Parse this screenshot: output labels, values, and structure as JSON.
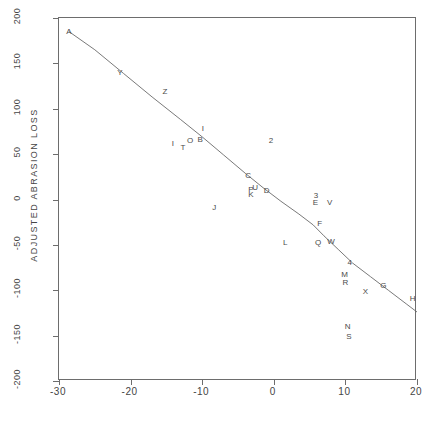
{
  "chart_data": {
    "type": "scatter",
    "title": "",
    "xlabel": "",
    "ylabel": "ADJUSTED ABRASION LOSS",
    "xlim": [
      -30,
      20
    ],
    "ylim": [
      -200,
      200
    ],
    "xticks": [
      -30,
      -20,
      -10,
      0,
      10,
      20
    ],
    "yticks": [
      -200,
      -150,
      -100,
      -50,
      0,
      50,
      100,
      150,
      200
    ],
    "xtick_labels": [
      "-30",
      "-20",
      "-10",
      "0",
      "10",
      "20"
    ],
    "ytick_labels": [
      "-200",
      "-150",
      "-100",
      "-50",
      "0",
      "50",
      "100",
      "150",
      "200"
    ],
    "grid": false,
    "legend": false,
    "point_marker": "letter-label",
    "points": [
      {
        "label": "A",
        "x": -28.6,
        "y": 185
      },
      {
        "label": "Y",
        "x": -21.5,
        "y": 139
      },
      {
        "label": "Z",
        "x": -15.2,
        "y": 119
      },
      {
        "label": "I",
        "x": -9.9,
        "y": 78
      },
      {
        "label": "I",
        "x": -14.1,
        "y": 61
      },
      {
        "label": "T",
        "x": -12.7,
        "y": 57
      },
      {
        "label": "O",
        "x": -11.7,
        "y": 64
      },
      {
        "label": "B",
        "x": -10.3,
        "y": 66
      },
      {
        "label": "2",
        "x": -0.4,
        "y": 64
      },
      {
        "label": "J",
        "x": -8.3,
        "y": -9
      },
      {
        "label": "C",
        "x": -3.6,
        "y": 26
      },
      {
        "label": "P",
        "x": -3.2,
        "y": 10
      },
      {
        "label": "U",
        "x": -2.6,
        "y": 13
      },
      {
        "label": "K",
        "x": -3.2,
        "y": 5
      },
      {
        "label": "D",
        "x": -1.0,
        "y": 9
      },
      {
        "label": "3",
        "x": 5.9,
        "y": 4
      },
      {
        "label": "E",
        "x": 5.8,
        "y": -4
      },
      {
        "label": "V",
        "x": 7.8,
        "y": -4
      },
      {
        "label": "F",
        "x": 6.4,
        "y": -27
      },
      {
        "label": "L",
        "x": 1.6,
        "y": -48
      },
      {
        "label": "Q",
        "x": 6.2,
        "y": -48
      },
      {
        "label": "W",
        "x": 8.0,
        "y": -47
      },
      {
        "label": "4",
        "x": 10.6,
        "y": -70
      },
      {
        "label": "M",
        "x": 9.9,
        "y": -83
      },
      {
        "label": "R",
        "x": 10.0,
        "y": -92
      },
      {
        "label": "G",
        "x": 15.3,
        "y": -95
      },
      {
        "label": "X",
        "x": 12.8,
        "y": -102
      },
      {
        "label": "H",
        "x": 19.4,
        "y": -110
      },
      {
        "label": "N",
        "x": 10.3,
        "y": -141
      },
      {
        "label": "S",
        "x": 10.5,
        "y": -152
      }
    ],
    "fit_curve": {
      "name": "lowess-fit",
      "x": [
        -28.6,
        -25.0,
        -21.0,
        -17.0,
        -13.0,
        -10.0,
        -7.0,
        -4.0,
        -1.5,
        1.0,
        3.5,
        5.5,
        7.0,
        9.0,
        11.0,
        13.5,
        16.0,
        18.5,
        20.0
      ],
      "y": [
        185,
        165,
        139,
        113,
        88,
        69,
        49,
        29,
        13,
        -2,
        -16,
        -28,
        -40,
        -55,
        -70,
        -85,
        -100,
        -115,
        -124
      ]
    },
    "colors": {
      "axis": "#6d6d6d",
      "text": "#454545",
      "point": "#4a4a4a",
      "curve": "#6a6a6a",
      "background": "#ffffff"
    }
  }
}
